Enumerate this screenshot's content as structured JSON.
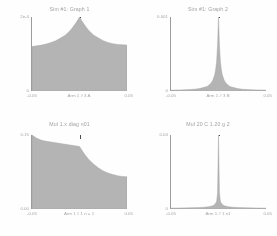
{
  "figure": {
    "background_color": "#fefefe",
    "fill_color": "#b4b4b4",
    "axis_color": "#9b9b9b",
    "marker_color": "#4a4a4a",
    "text_color": "#a2a2a2",
    "panel_count": 4,
    "layout": "2x2 grid"
  },
  "chart_data": [
    {
      "id": "top-left",
      "type": "area",
      "title": "Sim #1: Graph 1",
      "xlabel": "Arm 1 # 3 A",
      "ylabel": "",
      "grid": false,
      "legend": null,
      "ytick_top": "2e-4",
      "ytick_bottom": "0",
      "xtick_left": "-0.05",
      "xtick_right": "0.05",
      "xtick_center": "Arm 1 # 3 A",
      "ylim": [
        0,
        0.0002
      ],
      "xlim": [
        -0.05,
        0.05
      ],
      "marker_x": 0.0,
      "marker_label": "peak",
      "shape": "broad-tent-with-central-spike",
      "x": [
        -0.05,
        -0.045,
        -0.04,
        -0.035,
        -0.03,
        -0.025,
        -0.02,
        -0.015,
        -0.01,
        -0.0075,
        -0.005,
        -0.0025,
        0.0,
        0.0025,
        0.005,
        0.0075,
        0.01,
        0.015,
        0.02,
        0.025,
        0.03,
        0.035,
        0.04,
        0.045,
        0.05
      ],
      "values": [
        0.6,
        0.61,
        0.62,
        0.635,
        0.655,
        0.68,
        0.715,
        0.755,
        0.815,
        0.855,
        0.9,
        0.945,
        1.0,
        0.945,
        0.9,
        0.855,
        0.815,
        0.755,
        0.715,
        0.68,
        0.655,
        0.64,
        0.63,
        0.625,
        0.62
      ]
    },
    {
      "id": "top-right",
      "type": "area",
      "title": "Sim #1: Graph 2",
      "xlabel": "Arm 1 # 3 B",
      "ylabel": "",
      "grid": false,
      "legend": null,
      "ytick_top": "0.001",
      "ytick_bottom": "0",
      "xtick_left": "-0.05",
      "xtick_right": "0.05",
      "xtick_center": "Arm 1 # 3 B",
      "ylim": [
        0,
        0.001
      ],
      "xlim": [
        -0.05,
        0.05
      ],
      "marker_x": 0.0,
      "marker_label": "peak",
      "shape": "sharp-peak-heavy-tails",
      "x": [
        -0.05,
        -0.04,
        -0.03,
        -0.025,
        -0.02,
        -0.015,
        -0.012,
        -0.01,
        -0.008,
        -0.006,
        -0.004,
        -0.003,
        -0.002,
        -0.001,
        0.0,
        0.001,
        0.002,
        0.003,
        0.004,
        0.006,
        0.008,
        0.01,
        0.012,
        0.015,
        0.02,
        0.025,
        0.03,
        0.04,
        0.05
      ],
      "values": [
        0.012,
        0.015,
        0.02,
        0.025,
        0.033,
        0.05,
        0.062,
        0.08,
        0.105,
        0.145,
        0.22,
        0.29,
        0.4,
        0.62,
        1.0,
        0.62,
        0.4,
        0.29,
        0.22,
        0.145,
        0.105,
        0.08,
        0.062,
        0.05,
        0.033,
        0.025,
        0.02,
        0.015,
        0.012
      ]
    },
    {
      "id": "bottom-left",
      "type": "area",
      "title": "Mul 1.x diag n01",
      "xlabel": "Arm 1 # 1 n = 1",
      "ylabel": "",
      "grid": false,
      "legend": null,
      "ytick_top": "0.15",
      "ytick_bottom": "0.00",
      "xtick_left": "-0.05",
      "xtick_right": "0.05",
      "xtick_center": "Arm 1 # 1 n = 1",
      "ylim": [
        0,
        0.15
      ],
      "xlim": [
        -0.05,
        0.05
      ],
      "marker_x": 0.0,
      "marker_label": "cut",
      "shape": "monotonic-decay-step",
      "x": [
        -0.05,
        -0.045,
        -0.04,
        -0.035,
        -0.03,
        -0.025,
        -0.02,
        -0.015,
        -0.01,
        -0.005,
        0.0,
        0.005,
        0.01,
        0.015,
        0.02,
        0.025,
        0.03,
        0.035,
        0.04,
        0.045,
        0.05
      ],
      "values": [
        1.0,
        0.955,
        0.93,
        0.915,
        0.905,
        0.895,
        0.885,
        0.875,
        0.865,
        0.855,
        0.845,
        0.745,
        0.665,
        0.605,
        0.555,
        0.515,
        0.485,
        0.465,
        0.45,
        0.44,
        0.435
      ]
    },
    {
      "id": "bottom-right",
      "type": "area",
      "title": "Mul 20 C 1.20 g 2",
      "xlabel": "Arm 1 # 1 n1",
      "ylabel": "",
      "grid": false,
      "legend": null,
      "ytick_top": "0.04",
      "ytick_bottom": "0",
      "xtick_left": "-0.05",
      "xtick_right": "0.05",
      "xtick_center": "Arm 1 # 1 n1",
      "ylim": [
        0,
        0.04
      ],
      "xlim": [
        -0.05,
        0.05
      ],
      "marker_x": 0.0,
      "marker_label": "delta-spike",
      "shape": "narrow-delta-spike-flat-baseline",
      "x": [
        -0.05,
        -0.04,
        -0.03,
        -0.02,
        -0.015,
        -0.01,
        -0.006,
        -0.004,
        -0.002,
        -0.001,
        0.0,
        0.001,
        0.002,
        0.004,
        0.006,
        0.01,
        0.015,
        0.02,
        0.03,
        0.04,
        0.05
      ],
      "values": [
        0.012,
        0.014,
        0.016,
        0.02,
        0.024,
        0.032,
        0.045,
        0.06,
        0.1,
        0.22,
        1.0,
        0.22,
        0.1,
        0.06,
        0.045,
        0.032,
        0.024,
        0.02,
        0.016,
        0.014,
        0.012
      ]
    }
  ]
}
